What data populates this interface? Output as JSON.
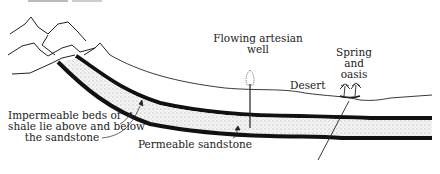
{
  "labels": {
    "well_line1": "Flowing artesian",
    "well_line2": "well",
    "spring_line1": "Spring",
    "spring_line2": "and",
    "spring_line3": "oasis",
    "desert": "Desert",
    "shale_line1": "Impermeable beds of",
    "shale_line2": "shale lie above and below",
    "shale_line3": "the sandstone",
    "sandstone": "Permeable sandstone"
  },
  "colors": {
    "ink": "#111111",
    "sand": "#f2f2f2",
    "background": "#ffffff"
  }
}
